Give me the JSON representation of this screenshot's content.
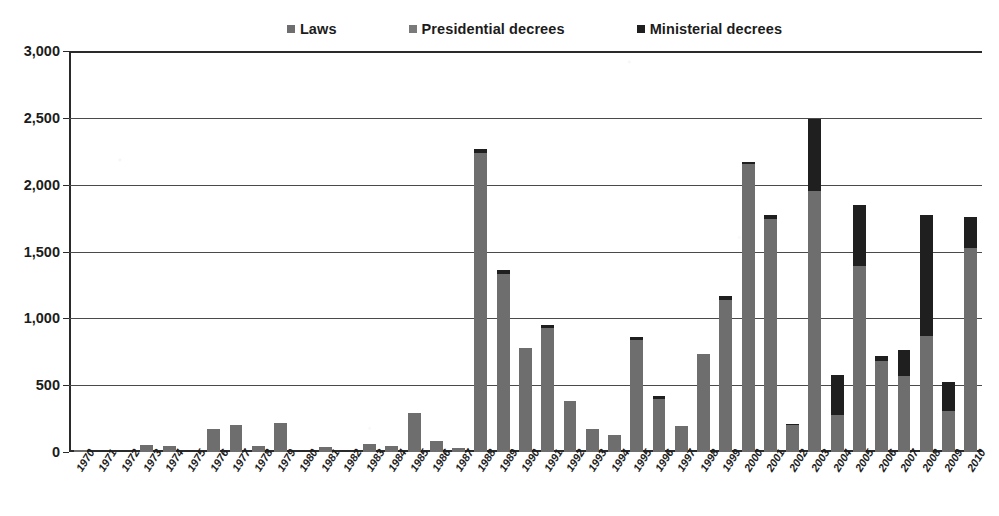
{
  "legend": {
    "items": [
      {
        "label": "Laws",
        "color": "#6e6e6e",
        "key": "laws"
      },
      {
        "label": "Presidential decrees",
        "color": "#7a7a7a",
        "key": "presidential"
      },
      {
        "label": "Ministerial decrees",
        "color": "#1f1f1f",
        "key": "ministerial"
      }
    ]
  },
  "axis": {
    "y_ticks": [
      "0",
      "500",
      "1,000",
      "1,500",
      "2,000",
      "2,500",
      "3,000"
    ],
    "y_tick_values": [
      0,
      500,
      1000,
      1500,
      2000,
      2500,
      3000
    ]
  },
  "chart_data": {
    "type": "bar",
    "stacked": true,
    "title": "",
    "subtitle": "",
    "xlabel": "",
    "ylabel": "",
    "ylim": [
      0,
      3000
    ],
    "ytick_step": 500,
    "grid": true,
    "legend_position": "top-center",
    "categories": [
      "1970",
      "1971",
      "1972",
      "1973",
      "1974",
      "1975",
      "1976",
      "1977",
      "1978",
      "1979",
      "1980",
      "1981",
      "1982",
      "1983",
      "1984",
      "1985",
      "1986",
      "1987",
      "1988",
      "1989",
      "1990",
      "1991",
      "1992",
      "1993",
      "1994",
      "1995",
      "1996",
      "1997",
      "1998",
      "1999",
      "2000",
      "2001",
      "2002",
      "2003",
      "2004",
      "2005",
      "2006",
      "2007",
      "2008",
      "2009",
      "2010"
    ],
    "series": [
      {
        "name": "Laws",
        "color": "#6e6e6e",
        "values": [
          15,
          0,
          0,
          55,
          45,
          0,
          170,
          205,
          45,
          220,
          0,
          35,
          0,
          60,
          45,
          290,
          85,
          30,
          2240,
          1330,
          775,
          930,
          385,
          170,
          125,
          840,
          400,
          195,
          730,
          1140,
          2155,
          1740,
          205,
          1955,
          280,
          1395,
          680,
          565,
          865,
          305,
          1530
        ]
      },
      {
        "name": "Presidential decrees",
        "color": "#7a7a7a",
        "values": [
          0,
          0,
          0,
          0,
          0,
          0,
          0,
          0,
          0,
          0,
          0,
          0,
          0,
          0,
          0,
          0,
          0,
          0,
          0,
          0,
          0,
          0,
          0,
          0,
          0,
          0,
          0,
          0,
          0,
          0,
          0,
          0,
          0,
          0,
          0,
          0,
          0,
          0,
          0,
          0,
          0
        ]
      },
      {
        "name": "Ministerial decrees",
        "color": "#1f1f1f",
        "values": [
          0,
          0,
          0,
          0,
          0,
          0,
          0,
          0,
          0,
          0,
          0,
          0,
          0,
          0,
          0,
          0,
          0,
          0,
          25,
          30,
          0,
          20,
          0,
          0,
          0,
          20,
          20,
          0,
          0,
          25,
          15,
          35,
          5,
          535,
          295,
          455,
          35,
          195,
          905,
          220,
          230
        ]
      }
    ],
    "totals": [
      15,
      0,
      0,
      55,
      45,
      0,
      170,
      205,
      45,
      220,
      0,
      35,
      0,
      60,
      45,
      290,
      85,
      30,
      2265,
      1360,
      775,
      950,
      385,
      170,
      125,
      860,
      420,
      195,
      730,
      1165,
      2170,
      1775,
      210,
      2490,
      575,
      1850,
      715,
      760,
      1770,
      525,
      1760
    ]
  }
}
